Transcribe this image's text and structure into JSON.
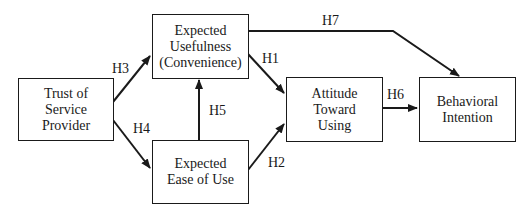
{
  "diagram": {
    "type": "path-model",
    "nodes": [
      {
        "id": "trust",
        "lines": [
          "Trust of",
          "Service",
          "Provider"
        ]
      },
      {
        "id": "usefulness",
        "lines": [
          "Expected",
          "Usefulness",
          "(Convenience)"
        ]
      },
      {
        "id": "ease",
        "lines": [
          "Expected",
          "Ease of Use"
        ]
      },
      {
        "id": "attitude",
        "lines": [
          "Attitude",
          "Toward",
          "Using"
        ]
      },
      {
        "id": "intention",
        "lines": [
          "Behavioral",
          "Intention"
        ]
      }
    ],
    "edges": [
      {
        "label": "H1",
        "from": "usefulness",
        "to": "attitude"
      },
      {
        "label": "H2",
        "from": "ease",
        "to": "attitude"
      },
      {
        "label": "H3",
        "from": "trust",
        "to": "usefulness"
      },
      {
        "label": "H4",
        "from": "trust",
        "to": "ease"
      },
      {
        "label": "H5",
        "from": "ease",
        "to": "usefulness"
      },
      {
        "label": "H6",
        "from": "attitude",
        "to": "intention"
      },
      {
        "label": "H7",
        "from": "usefulness",
        "to": "intention"
      }
    ],
    "colors": {
      "line": "#1a1a1a",
      "background": "#ffffff"
    }
  }
}
